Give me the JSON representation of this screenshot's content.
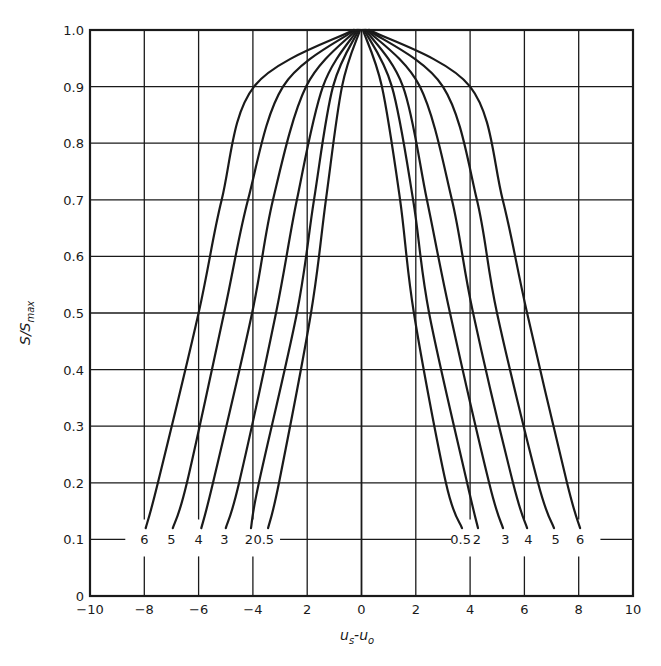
{
  "chart_data": {
    "type": "line",
    "title": "",
    "xlabel": "u_s - u_o",
    "ylabel": "S/S_max",
    "xlim": [
      -10,
      10
    ],
    "ylim": [
      0,
      1.0
    ],
    "grid": true,
    "x_tick_values": [
      -10,
      -8,
      -6,
      -4,
      -2,
      0,
      2,
      4,
      6,
      8,
      10
    ],
    "x_tick_labels": [
      "-10",
      "-8",
      "-6",
      "-4",
      "2",
      "0",
      "2",
      "4",
      "6",
      "8",
      "10"
    ],
    "y_tick_values": [
      0,
      0.1,
      0.2,
      0.3,
      0.4,
      0.5,
      0.6,
      0.7,
      0.8,
      0.9,
      1.0
    ],
    "y_tick_labels": [
      "0",
      "0.1",
      "0.2",
      "0.3",
      "0.4",
      "0.5",
      "0.6",
      "0.7",
      "0.8",
      "0.9",
      "1.0"
    ],
    "legend": "inline curve labels at S/S_max = 0.1",
    "series": [
      {
        "name": "6",
        "left": {
          "y": [
            0.12,
            0.2,
            0.5,
            0.7,
            0.9,
            1.0
          ],
          "x": [
            -7.95,
            -7.5,
            -6.0,
            -5.15,
            -3.96,
            -0.3
          ]
        },
        "right": {
          "y": [
            1.0,
            0.9,
            0.7,
            0.5,
            0.2,
            0.12
          ],
          "x": [
            0.3,
            4.0,
            5.2,
            6.1,
            7.57,
            8.05
          ]
        }
      },
      {
        "name": "5",
        "left": {
          "y": [
            0.12,
            0.2,
            0.5,
            0.7,
            0.9,
            1.0
          ],
          "x": [
            -6.95,
            -6.43,
            -5.06,
            -4.18,
            -2.89,
            -0.25
          ]
        },
        "right": {
          "y": [
            1.0,
            0.9,
            0.7,
            0.5,
            0.2,
            0.12
          ],
          "x": [
            0.25,
            3.0,
            4.25,
            4.99,
            6.5,
            7.09
          ]
        }
      },
      {
        "name": "4",
        "left": {
          "y": [
            0.12,
            0.2,
            0.5,
            0.7,
            0.9,
            1.0
          ],
          "x": [
            -5.9,
            -5.47,
            -4.03,
            -3.26,
            -2.04,
            -0.2
          ]
        },
        "right": {
          "y": [
            1.0,
            0.9,
            0.7,
            0.5,
            0.2,
            0.12
          ],
          "x": [
            0.2,
            2.15,
            3.33,
            4.11,
            5.58,
            6.1
          ]
        }
      },
      {
        "name": "3",
        "left": {
          "y": [
            0.12,
            0.2,
            0.5,
            0.7,
            0.9,
            1.0
          ],
          "x": [
            -5.0,
            -4.51,
            -3.15,
            -2.38,
            -1.42,
            -0.15
          ]
        },
        "right": {
          "y": [
            1.0,
            0.9,
            0.7,
            0.5,
            0.2,
            0.12
          ],
          "x": [
            0.15,
            1.53,
            2.41,
            3.26,
            4.7,
            5.21
          ]
        }
      },
      {
        "name": "2",
        "left": {
          "y": [
            0.12,
            0.2,
            0.5,
            0.7,
            0.9,
            1.0
          ],
          "x": [
            -4.07,
            -3.78,
            -2.38,
            -1.75,
            -1.05,
            -0.1
          ]
        },
        "right": {
          "y": [
            1.0,
            0.9,
            0.7,
            0.5,
            0.2,
            0.12
          ],
          "x": [
            0.1,
            1.12,
            1.9,
            2.49,
            3.89,
            4.29
          ]
        }
      },
      {
        "name": "0.5",
        "left": {
          "y": [
            0.12,
            0.2,
            0.5,
            0.7,
            0.9,
            1.0
          ],
          "x": [
            -3.44,
            -3.04,
            -1.86,
            -1.31,
            -0.72,
            -0.05
          ]
        },
        "right": {
          "y": [
            1.0,
            0.9,
            0.7,
            0.5,
            0.2,
            0.12
          ],
          "x": [
            0.05,
            0.75,
            1.42,
            1.93,
            3.11,
            3.7
          ]
        }
      }
    ],
    "curve_labels_left": [
      "6",
      "5",
      "4",
      "3",
      "2",
      "0.5"
    ],
    "curve_labels_right": [
      "0.5",
      "2",
      "3",
      "4",
      "5",
      "6"
    ],
    "curve_label_level": 0.1
  },
  "axes": {
    "x_title_main": "u",
    "x_title_sub1": "s",
    "x_title_sep": "-u",
    "x_title_sub2": "o",
    "y_title_main": "S/S",
    "y_title_sub": "max"
  },
  "colors": {
    "ink": "#1a1a1a",
    "background": "#ffffff"
  }
}
